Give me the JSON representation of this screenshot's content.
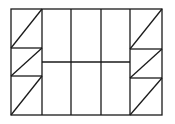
{
  "diagram": {
    "type": "geometric-figure",
    "stroke_color": "#1a1a1a",
    "background": "#ffffff",
    "outer_rect": {
      "x": 11,
      "y": 9,
      "w": 151,
      "h": 106
    },
    "left_column": {
      "x1": 11,
      "x2": 42,
      "dividers_y": [
        48,
        76
      ]
    },
    "right_column": {
      "x1": 130,
      "x2": 162,
      "dividers_y": [
        49,
        78
      ]
    },
    "center": {
      "vertical_x": [
        71,
        101
      ],
      "horizontal_y": 62
    }
  }
}
